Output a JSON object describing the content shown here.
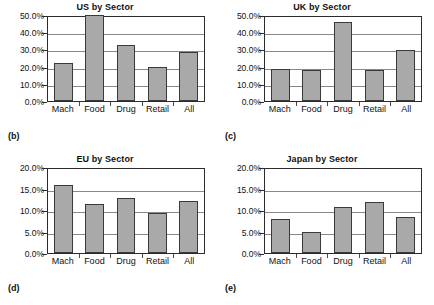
{
  "figure": {
    "panels": [
      {
        "tag": "(b)",
        "title": "US by Sector",
        "y_ticks": [
          "0.0%",
          "10.0%",
          "20.0%",
          "30.0%",
          "40.0%",
          "50.0%"
        ],
        "categories": [
          "Mach",
          "Food",
          "Drug",
          "Retail",
          "All"
        ],
        "values": [
          22.3,
          50.2,
          32.3,
          19.5,
          28.3
        ],
        "ymin": 0,
        "ymax": 50
      },
      {
        "tag": "(c)",
        "title": "UK by Sector",
        "y_ticks": [
          "0.0%",
          "10.0%",
          "20.0%",
          "30.0%",
          "40.0%",
          "50.0%"
        ],
        "categories": [
          "Mach",
          "Food",
          "Drug",
          "Retail",
          "All"
        ],
        "values": [
          18.4,
          17.8,
          46.0,
          18.2,
          29.5
        ],
        "ymin": 0,
        "ymax": 50
      },
      {
        "tag": "(d)",
        "title": "EU by Sector",
        "y_ticks": [
          "0.0%",
          "5.0%",
          "10.0%",
          "15.0%",
          "20.0%"
        ],
        "categories": [
          "Mach",
          "Food",
          "Drug",
          "Retail",
          "All"
        ],
        "values": [
          15.9,
          11.3,
          12.9,
          9.4,
          12.0
        ],
        "ymin": 0,
        "ymax": 20
      },
      {
        "tag": "(e)",
        "title": "Japan by Sector",
        "y_ticks": [
          "0.0%",
          "5.0%",
          "10.0%",
          "15.0%",
          "20.0%"
        ],
        "categories": [
          "Mach",
          "Food",
          "Drug",
          "Retail",
          "All"
        ],
        "values": [
          7.9,
          5.0,
          10.6,
          11.8,
          8.4
        ],
        "ymin": 0,
        "ymax": 20
      }
    ]
  },
  "chart_data": [
    {
      "type": "bar",
      "title": "US by Sector",
      "panel_tag": "(b)",
      "categories": [
        "Mach",
        "Food",
        "Drug",
        "Retail",
        "All"
      ],
      "values": [
        22.3,
        50.2,
        32.3,
        19.5,
        28.3
      ],
      "xlabel": "",
      "ylabel": "",
      "ylim": [
        0,
        50
      ],
      "ytick_labels": [
        "0.0%",
        "10.0%",
        "20.0%",
        "30.0%",
        "40.0%",
        "50.0%"
      ],
      "ytick_values": [
        0,
        10,
        20,
        30,
        40,
        50
      ],
      "grid": true,
      "legend": "none",
      "bar_color": "#a9a9a9",
      "bar_edge_color": "#3a3a3a"
    },
    {
      "type": "bar",
      "title": "UK by Sector",
      "panel_tag": "(c)",
      "categories": [
        "Mach",
        "Food",
        "Drug",
        "Retail",
        "All"
      ],
      "values": [
        18.4,
        17.8,
        46.0,
        18.2,
        29.5
      ],
      "xlabel": "",
      "ylabel": "",
      "ylim": [
        0,
        50
      ],
      "ytick_labels": [
        "0.0%",
        "10.0%",
        "20.0%",
        "30.0%",
        "40.0%",
        "50.0%"
      ],
      "ytick_values": [
        0,
        10,
        20,
        30,
        40,
        50
      ],
      "grid": true,
      "legend": "none",
      "bar_color": "#a9a9a9",
      "bar_edge_color": "#3a3a3a"
    },
    {
      "type": "bar",
      "title": "EU by Sector",
      "panel_tag": "(d)",
      "categories": [
        "Mach",
        "Food",
        "Drug",
        "Retail",
        "All"
      ],
      "values": [
        15.9,
        11.3,
        12.9,
        9.4,
        12.0
      ],
      "xlabel": "",
      "ylabel": "",
      "ylim": [
        0,
        20
      ],
      "ytick_labels": [
        "0.0%",
        "5.0%",
        "10.0%",
        "15.0%",
        "20.0%"
      ],
      "ytick_values": [
        0,
        5,
        10,
        15,
        20
      ],
      "grid": true,
      "legend": "none",
      "bar_color": "#a9a9a9",
      "bar_edge_color": "#3a3a3a"
    },
    {
      "type": "bar",
      "title": "Japan by Sector",
      "panel_tag": "(e)",
      "categories": [
        "Mach",
        "Food",
        "Drug",
        "Retail",
        "All"
      ],
      "values": [
        7.9,
        5.0,
        10.6,
        11.8,
        8.4
      ],
      "xlabel": "",
      "ylabel": "",
      "ylim": [
        0,
        20
      ],
      "ytick_labels": [
        "0.0%",
        "5.0%",
        "10.0%",
        "15.0%",
        "20.0%"
      ],
      "ytick_values": [
        0,
        5,
        10,
        15,
        20
      ],
      "grid": true,
      "legend": "none",
      "bar_color": "#a9a9a9",
      "bar_edge_color": "#3a3a3a"
    }
  ]
}
